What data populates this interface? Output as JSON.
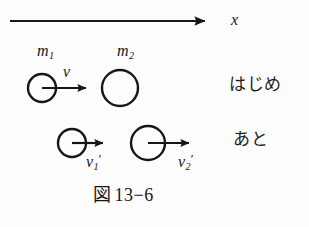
{
  "figure": {
    "caption_zu": "図",
    "caption_number": "13−6",
    "caption_full": "図 13−6",
    "background_color": "#fdfdfd",
    "stroke_color": "#161616"
  },
  "axis": {
    "label": "x",
    "name": "x-axis",
    "x_start": 10,
    "x_end": 214,
    "y": 21
  },
  "rows": [
    {
      "state_label": "はじめ",
      "state_meaning": "before",
      "bodies": [
        {
          "mass_label": "m",
          "mass_subscript": "1",
          "velocity_label": "v",
          "velocity_subscript": "",
          "velocity_prime": "",
          "cx": 42,
          "cy": 88,
          "r": 14,
          "arrow_from": 42,
          "arrow_to": 96,
          "has_arrow": true
        },
        {
          "mass_label": "m",
          "mass_subscript": "2",
          "velocity_label": "",
          "velocity_subscript": "",
          "velocity_prime": "",
          "cx": 120,
          "cy": 88,
          "r": 18,
          "arrow_from": 0,
          "arrow_to": 0,
          "has_arrow": false
        }
      ]
    },
    {
      "state_label": "あと",
      "state_meaning": "after",
      "bodies": [
        {
          "mass_label": "",
          "mass_subscript": "",
          "velocity_label": "v",
          "velocity_subscript": "1",
          "velocity_prime": "′",
          "cx": 72,
          "cy": 143,
          "r": 14,
          "arrow_from": 72,
          "arrow_to": 112,
          "has_arrow": true
        },
        {
          "mass_label": "",
          "mass_subscript": "",
          "velocity_label": "v",
          "velocity_subscript": "2",
          "velocity_prime": "′",
          "cx": 148,
          "cy": 143,
          "r": 17,
          "arrow_from": 148,
          "arrow_to": 198,
          "has_arrow": true
        }
      ]
    }
  ],
  "labels": {
    "axis_x": "x",
    "m1_base": "m",
    "m1_sub": "1",
    "m2_base": "m",
    "m2_sub": "2",
    "v_base": "v",
    "v1_base": "v",
    "v1_sub": "1",
    "v1_prime": "′",
    "v2_base": "v",
    "v2_sub": "2",
    "v2_prime": "′",
    "before": "はじめ",
    "after": "あと"
  }
}
